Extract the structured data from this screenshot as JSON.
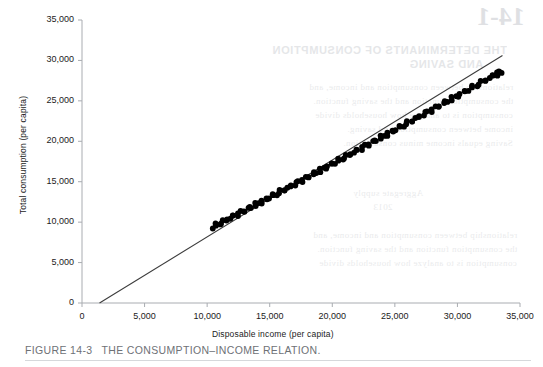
{
  "figure": {
    "number": "FIGURE 14-3",
    "caption": "THE CONSUMPTION–INCOME RELATION."
  },
  "colors": {
    "axis": "#a9acb1",
    "tick_text": "#1b1b1b",
    "scatter": "#000000",
    "regression_line": "#3c3c3c",
    "caption_text": "#6e7176",
    "caption_rule": "#d6d8db",
    "background": "#ffffff",
    "bleed_text": "#b9bcc2"
  },
  "bleed_through": {
    "number": "14-1",
    "heading_line_1": "THE DETERMINANTS OF CONSUMPTION",
    "heading_line_2": "AND SAVING",
    "body_lines": [
      "relationship between consumption and income, and",
      "the consumption function and the saving function.",
      "consumption is to analyze how households divide",
      "income between consumption and saving.",
      "Saving equals income minus consumption."
    ],
    "side_note": "Aggregate supply",
    "side_note_2": "2013"
  },
  "chart_data": {
    "type": "scatter",
    "title": "",
    "xlabel": "Disposable income (per capita)",
    "ylabel": "Total consumption (per capita)",
    "xlim": [
      0,
      35000
    ],
    "ylim": [
      0,
      35000
    ],
    "xticks": [
      0,
      5000,
      10000,
      15000,
      20000,
      25000,
      30000,
      35000
    ],
    "yticks": [
      0,
      5000,
      10000,
      15000,
      20000,
      25000,
      30000,
      35000
    ],
    "xtick_labels": [
      "0",
      "5,000",
      "10,000",
      "15,000",
      "20,000",
      "25,000",
      "30,000",
      "35,000"
    ],
    "ytick_labels": [
      "0",
      "5,000",
      "10,000",
      "15,000",
      "20,000",
      "25,000",
      "30,000",
      "35,000"
    ],
    "grid": false,
    "legend": false,
    "regression_line": {
      "label": "consumption function",
      "x_start": 1400,
      "y_start": 0,
      "x_end": 33600,
      "y_end": 30600,
      "slope": 0.951,
      "intercept": -1331
    },
    "points": [
      [
        10450,
        9400
      ],
      [
        10620,
        9530
      ],
      [
        10790,
        9660
      ],
      [
        10960,
        9800
      ],
      [
        11130,
        9960
      ],
      [
        11310,
        10110
      ],
      [
        11480,
        10230
      ],
      [
        11650,
        10360
      ],
      [
        11820,
        10490
      ],
      [
        12000,
        10640
      ],
      [
        12180,
        10790
      ],
      [
        12350,
        10930
      ],
      [
        12520,
        11060
      ],
      [
        12700,
        11210
      ],
      [
        12880,
        11360
      ],
      [
        13050,
        11490
      ],
      [
        13230,
        11630
      ],
      [
        13400,
        11760
      ],
      [
        13580,
        11910
      ],
      [
        13760,
        12060
      ],
      [
        13930,
        12190
      ],
      [
        14110,
        12340
      ],
      [
        14290,
        12490
      ],
      [
        14460,
        12620
      ],
      [
        14640,
        12770
      ],
      [
        14820,
        12920
      ],
      [
        15000,
        13070
      ],
      [
        15170,
        13200
      ],
      [
        15350,
        13340
      ],
      [
        15530,
        13490
      ],
      [
        15710,
        13640
      ],
      [
        15890,
        13790
      ],
      [
        16070,
        13940
      ],
      [
        16250,
        14090
      ],
      [
        16420,
        14220
      ],
      [
        16600,
        14370
      ],
      [
        16780,
        14520
      ],
      [
        16960,
        14670
      ],
      [
        17140,
        14820
      ],
      [
        17320,
        14970
      ],
      [
        17500,
        15120
      ],
      [
        17680,
        15270
      ],
      [
        17860,
        15420
      ],
      [
        18040,
        15570
      ],
      [
        18220,
        15720
      ],
      [
        18400,
        15870
      ],
      [
        18580,
        16020
      ],
      [
        18760,
        16170
      ],
      [
        18940,
        16320
      ],
      [
        19120,
        16470
      ],
      [
        19310,
        16630
      ],
      [
        19490,
        16780
      ],
      [
        19670,
        16930
      ],
      [
        19850,
        17080
      ],
      [
        20040,
        17240
      ],
      [
        20220,
        17390
      ],
      [
        20400,
        17540
      ],
      [
        20590,
        17700
      ],
      [
        20770,
        17850
      ],
      [
        20960,
        18010
      ],
      [
        21140,
        18160
      ],
      [
        21330,
        18320
      ],
      [
        21510,
        18470
      ],
      [
        21700,
        18630
      ],
      [
        21880,
        18780
      ],
      [
        22070,
        18940
      ],
      [
        22260,
        19100
      ],
      [
        22440,
        19250
      ],
      [
        22630,
        19410
      ],
      [
        22820,
        19570
      ],
      [
        23010,
        19730
      ],
      [
        23190,
        19880
      ],
      [
        23380,
        20040
      ],
      [
        23570,
        20200
      ],
      [
        23760,
        20360
      ],
      [
        23950,
        20520
      ],
      [
        24140,
        20680
      ],
      [
        24330,
        20840
      ],
      [
        24520,
        21000
      ],
      [
        24710,
        21160
      ],
      [
        24900,
        21320
      ],
      [
        25100,
        21490
      ],
      [
        25290,
        21650
      ],
      [
        25480,
        21810
      ],
      [
        25680,
        21980
      ],
      [
        25870,
        22140
      ],
      [
        26060,
        22300
      ],
      [
        26260,
        22470
      ],
      [
        26450,
        22630
      ],
      [
        26650,
        22800
      ],
      [
        26850,
        22970
      ],
      [
        27040,
        23130
      ],
      [
        27240,
        23300
      ],
      [
        27440,
        23470
      ],
      [
        27630,
        23630
      ],
      [
        27830,
        23800
      ],
      [
        28030,
        23970
      ],
      [
        28230,
        24140
      ],
      [
        28430,
        24310
      ],
      [
        28630,
        24480
      ],
      [
        28830,
        24650
      ],
      [
        29030,
        24820
      ],
      [
        29240,
        25000
      ],
      [
        29440,
        25170
      ],
      [
        29640,
        25340
      ],
      [
        29850,
        25520
      ],
      [
        30050,
        25690
      ],
      [
        30260,
        25870
      ],
      [
        30460,
        26040
      ],
      [
        30670,
        26220
      ],
      [
        30880,
        26400
      ],
      [
        31080,
        26570
      ],
      [
        31290,
        26750
      ],
      [
        31500,
        26930
      ],
      [
        31710,
        27110
      ],
      [
        31920,
        27290
      ],
      [
        32130,
        27470
      ],
      [
        32340,
        27650
      ],
      [
        32550,
        27830
      ],
      [
        32760,
        28010
      ],
      [
        32930,
        28160
      ],
      [
        33080,
        28290
      ],
      [
        33220,
        28410
      ],
      [
        33340,
        28510
      ],
      [
        33430,
        28590
      ],
      [
        33500,
        28650
      ]
    ]
  }
}
